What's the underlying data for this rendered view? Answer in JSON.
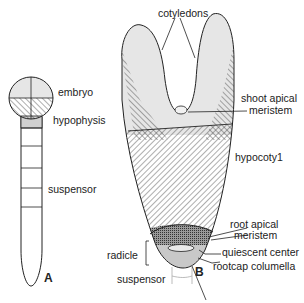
{
  "figure": {
    "panel_a": {
      "letter": "A",
      "labels": {
        "embryo": "embryo",
        "hypophysis": "hypophysis",
        "suspensor": "suspensor"
      }
    },
    "panel_b": {
      "letter": "B",
      "labels": {
        "cotyledons": "cotyledons",
        "shoot_apical_meristem_1": "shoot apical",
        "shoot_apical_meristem_2": "meristem",
        "hypocotyl": "hypocoty1",
        "root_apical_meristem_1": "root apical",
        "root_apical_meristem_2": "meristem",
        "quiescent_center": "quiescent center",
        "rootcap_columella": "rootcap columella",
        "radicle": "radicle",
        "suspensor": "suspensor"
      }
    },
    "colors": {
      "outline": "#222222",
      "light_fill": "#e6e6e6",
      "hatch": "#333333",
      "root_meristem": "#7a7a7a",
      "quiescent": "#9a9a9a",
      "rootcap": "#c8c8c8",
      "hypophysis": "#d0d0d0"
    }
  }
}
